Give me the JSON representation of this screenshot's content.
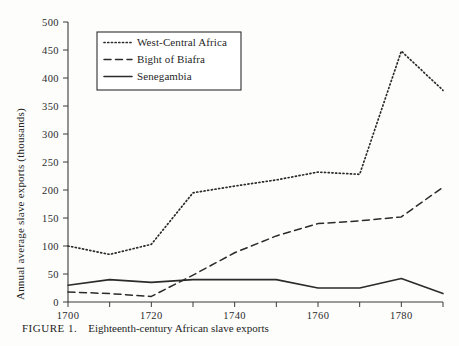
{
  "figure": {
    "number_label": "FIGURE 1.",
    "caption": "Eighteenth-century African slave exports"
  },
  "chart_data": {
    "type": "line",
    "title": "Eighteenth-century African slave exports",
    "xlabel": "",
    "ylabel": "Annual average slave exports (thousands)",
    "x": [
      1700,
      1710,
      1720,
      1730,
      1740,
      1750,
      1760,
      1770,
      1780,
      1790
    ],
    "xlim": [
      1700,
      1790
    ],
    "ylim": [
      0,
      500
    ],
    "xticks": [
      1700,
      1710,
      1720,
      1730,
      1740,
      1750,
      1760,
      1770,
      1780,
      1790
    ],
    "xtick_labels": [
      "1700",
      "",
      "1720",
      "",
      "1740",
      "",
      "1760",
      "",
      "1780",
      ""
    ],
    "yticks": [
      0,
      50,
      100,
      150,
      200,
      250,
      300,
      350,
      400,
      450,
      500
    ],
    "ytick_labels": [
      "0",
      "50",
      "100",
      "150",
      "200",
      "250",
      "300",
      "350",
      "400",
      "450",
      "500"
    ],
    "grid": false,
    "legend_position": "upper-left",
    "series": [
      {
        "name": "West-Central Africa",
        "style": "dotted",
        "color": "#2b2b2b",
        "values": [
          100,
          85,
          103,
          195,
          207,
          218,
          232,
          228,
          448,
          378
        ]
      },
      {
        "name": "Bight of Biafra",
        "style": "dashed",
        "color": "#2b2b2b",
        "values": [
          18,
          15,
          10,
          48,
          88,
          118,
          140,
          145,
          152,
          205
        ]
      },
      {
        "name": "Senegambia",
        "style": "solid",
        "color": "#2b2b2b",
        "values": [
          30,
          40,
          35,
          40,
          40,
          40,
          25,
          25,
          42,
          15
        ]
      }
    ]
  },
  "axis": {
    "y_title": "Annual average slave exports (thousands)"
  },
  "legend": {
    "entries": [
      {
        "label": "West-Central Africa",
        "style": "dotted"
      },
      {
        "label": "Bight of Biafra",
        "style": "dashed"
      },
      {
        "label": "Senegambia",
        "style": "solid"
      }
    ]
  }
}
